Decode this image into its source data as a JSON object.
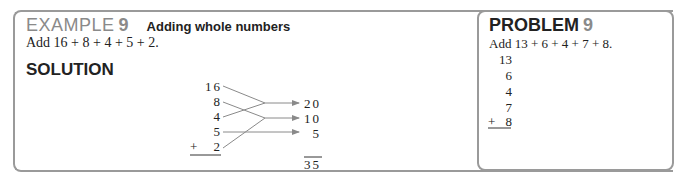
{
  "example": {
    "label": "EXAMPLE",
    "number": "9",
    "title": "Adding whole numbers",
    "problem": "Add 16 + 8 + 4 + 5 + 2.",
    "solution_heading": "SOLUTION",
    "addends": [
      "16",
      "8",
      "4",
      "5",
      "2"
    ],
    "plus_sign": "+",
    "partial_sums": [
      "20",
      "10",
      "5"
    ],
    "total": "35",
    "groupings": [
      {
        "addends": [
          "16",
          "4"
        ],
        "sum": "20"
      },
      {
        "addends": [
          "8",
          "2"
        ],
        "sum": "10"
      },
      {
        "addends": [
          "5"
        ],
        "sum": "5"
      }
    ]
  },
  "problem": {
    "label": "PROBLEM",
    "number": "9",
    "problem": "Add 13 + 6 + 4 + 7 + 8.",
    "addends": [
      "13",
      "6",
      "4",
      "7",
      "8"
    ],
    "plus_sign": "+"
  },
  "colors": {
    "border": "#9a9a9a",
    "accent_gray": "#8a8a8a",
    "text": "#222222"
  }
}
